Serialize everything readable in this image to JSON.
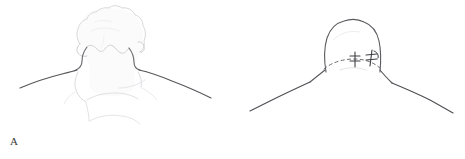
{
  "figure": {
    "background_color": "#ffffff",
    "width": 465,
    "height": 159,
    "caption": ""
  },
  "panels": [
    {
      "id": "A",
      "label": "A",
      "description": "Posterior view of head and neck with hair, line drawing",
      "ink_color_dark": "#4a4a4a",
      "ink_color_light": "#c9c9cc",
      "ink_color_faint": "#e2e2e5",
      "features": [
        "hair-outline",
        "hairline",
        "neck-left-edge",
        "neck-right-edge",
        "shoulder-left",
        "shoulder-right",
        "upper-back-contour"
      ]
    },
    {
      "id": "B",
      "label": "B",
      "description": "Posterior view of shaved head and neck with dashed incision line and two suture marks",
      "ink_color_dark": "#4a4a4a",
      "ink_color_light": "#b8b8bc",
      "ink_color_faint": "#d8d8dc",
      "dashed_line_label": "incision-line",
      "suture_marks_count": 2,
      "features": [
        "scalp-dome-outline",
        "dashed-incision-line",
        "suture-mark-left",
        "suture-mark-right",
        "neck-left-edge",
        "neck-right-edge",
        "shoulder-left",
        "shoulder-right"
      ]
    }
  ]
}
